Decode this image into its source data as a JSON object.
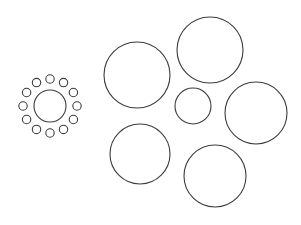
{
  "canvas": {
    "width": 301,
    "height": 225,
    "background_color": "#ffffff",
    "stroke_color": "#3c3c3c",
    "title": ""
  },
  "chart_data": {
    "type": "scatter",
    "title": "",
    "subtitle": "",
    "xlabel": "",
    "ylabel": "",
    "xlim": [
      0,
      301
    ],
    "ylim": [
      0,
      225
    ],
    "grid": false,
    "legend": "none",
    "annotations": [],
    "shape_type": "circle-outline",
    "total_shapes": 19,
    "groups": [
      {
        "name": "left-rosette-cluster",
        "count": 13,
        "center": [
          50,
          106
        ]
      },
      {
        "name": "right-large-circles",
        "count": 6
      }
    ],
    "series": [
      {
        "name": "large-circles",
        "stroke": "#3c3c3c",
        "stroke_width": 1.1,
        "points": [
          {
            "id": "large-top-left",
            "x": 137,
            "y": 75,
            "r": 33
          },
          {
            "id": "large-top-right",
            "x": 210,
            "y": 50,
            "r": 33
          },
          {
            "id": "large-right-middle",
            "x": 256,
            "y": 113,
            "r": 31
          },
          {
            "id": "large-bottom-left",
            "x": 140,
            "y": 154,
            "r": 30
          },
          {
            "id": "large-bottom-right",
            "x": 215,
            "y": 176,
            "r": 31
          },
          {
            "id": "medium-center",
            "x": 193,
            "y": 106,
            "r": 18
          }
        ]
      },
      {
        "name": "cluster-center-circle",
        "stroke": "#3c3c3c",
        "stroke_width": 1.1,
        "points": [
          {
            "id": "cluster-core",
            "x": 50,
            "y": 106,
            "r": 16
          }
        ]
      },
      {
        "name": "cluster-satellite-circles",
        "stroke": "#3c3c3c",
        "stroke_width": 1.1,
        "ring_radius": 27,
        "satellite_radius": 4.2,
        "count": 12,
        "points": [
          {
            "id": "satellite-01",
            "x": 50.0,
            "y": 79.0,
            "r": 4.2
          },
          {
            "id": "satellite-02",
            "x": 63.5,
            "y": 82.6,
            "r": 4.2
          },
          {
            "id": "satellite-03",
            "x": 73.4,
            "y": 92.5,
            "r": 4.2
          },
          {
            "id": "satellite-04",
            "x": 77.0,
            "y": 106.0,
            "r": 4.2
          },
          {
            "id": "satellite-05",
            "x": 73.4,
            "y": 119.5,
            "r": 4.2
          },
          {
            "id": "satellite-06",
            "x": 63.5,
            "y": 129.4,
            "r": 4.2
          },
          {
            "id": "satellite-07",
            "x": 50.0,
            "y": 133.0,
            "r": 4.2
          },
          {
            "id": "satellite-08",
            "x": 36.5,
            "y": 129.4,
            "r": 4.2
          },
          {
            "id": "satellite-09",
            "x": 26.6,
            "y": 119.5,
            "r": 4.2
          },
          {
            "id": "satellite-10",
            "x": 23.0,
            "y": 106.0,
            "r": 4.2
          },
          {
            "id": "satellite-11",
            "x": 26.6,
            "y": 92.5,
            "r": 4.2
          },
          {
            "id": "satellite-12",
            "x": 36.5,
            "y": 82.6,
            "r": 4.2
          }
        ]
      }
    ]
  }
}
